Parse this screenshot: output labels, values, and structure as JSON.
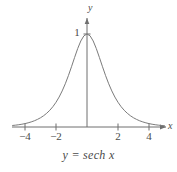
{
  "figure": {
    "caption": "y = sech x",
    "axis_labels": {
      "x": "x",
      "y": "y"
    },
    "y_tick_label": "1",
    "x_tick_labels": [
      "−4",
      "−2",
      "2",
      "4"
    ],
    "colors": {
      "curve": "#7b7b7b",
      "axis": "#6f6f6f",
      "text": "#4a4a4a",
      "background": "#ffffff"
    }
  },
  "chart_data": {
    "type": "line",
    "title": "",
    "subtitle": "",
    "caption": "y = sech x",
    "xlabel": "x",
    "ylabel": "y",
    "xlim": [
      -4.8,
      5.0
    ],
    "ylim": [
      0,
      1.12
    ],
    "xticks": [
      -4,
      -2,
      2,
      4
    ],
    "xtick_labels": [
      "−4",
      "−2",
      "2",
      "4"
    ],
    "yticks": [
      1
    ],
    "ytick_labels": [
      "1"
    ],
    "grid": false,
    "legend": null,
    "series": [
      {
        "name": "y = sech x",
        "color": "#7b7b7b",
        "x": [
          -4.8,
          -4.6,
          -4.4,
          -4.2,
          -4.0,
          -3.8,
          -3.6,
          -3.4,
          -3.2,
          -3.0,
          -2.8,
          -2.6,
          -2.4,
          -2.2,
          -2.0,
          -1.8,
          -1.6,
          -1.4,
          -1.2,
          -1.0,
          -0.8,
          -0.6,
          -0.4,
          -0.2,
          0.0,
          0.2,
          0.4,
          0.6,
          0.8,
          1.0,
          1.2,
          1.4,
          1.6,
          1.8,
          2.0,
          2.2,
          2.4,
          2.6,
          2.8,
          3.0,
          3.2,
          3.4,
          3.6,
          3.8,
          4.0,
          4.2,
          4.4,
          4.6,
          4.8,
          5.0
        ],
        "y": [
          0.0164,
          0.0201,
          0.0245,
          0.0299,
          0.0366,
          0.0447,
          0.0546,
          0.0667,
          0.0814,
          0.0993,
          0.1211,
          0.1476,
          0.1798,
          0.2186,
          0.2658,
          0.3218,
          0.388,
          0.465,
          0.5523,
          0.6481,
          0.7477,
          0.8436,
          0.925,
          0.9803,
          1.0,
          0.9803,
          0.925,
          0.8436,
          0.7477,
          0.6481,
          0.5523,
          0.465,
          0.388,
          0.3218,
          0.2658,
          0.2186,
          0.1798,
          0.1476,
          0.1211,
          0.0993,
          0.0814,
          0.0667,
          0.0546,
          0.0447,
          0.0366,
          0.0299,
          0.0245,
          0.0201,
          0.0164,
          0.0135
        ]
      }
    ]
  }
}
